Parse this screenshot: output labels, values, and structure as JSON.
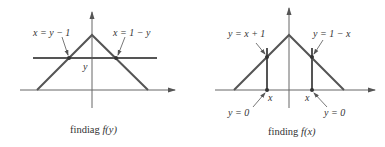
{
  "panels": [
    {
      "id": "left",
      "caption_prefix": "findiag ",
      "caption_func": "f(y)",
      "labels": {
        "left_line": "x = y − 1",
        "right_line": "x = 1 − y",
        "y_mark": "y"
      }
    },
    {
      "id": "right",
      "caption_prefix": "finding ",
      "caption_func": "f(x)",
      "labels": {
        "left_line": "y = x + 1",
        "right_line": "y = 1 − x",
        "left_x_mark": "x",
        "right_x_mark": "x",
        "left_bottom": "y = 0",
        "right_bottom": "y = 0"
      }
    }
  ],
  "colors": {
    "line": "#555555",
    "axis": "#666666",
    "text": "#333333"
  }
}
